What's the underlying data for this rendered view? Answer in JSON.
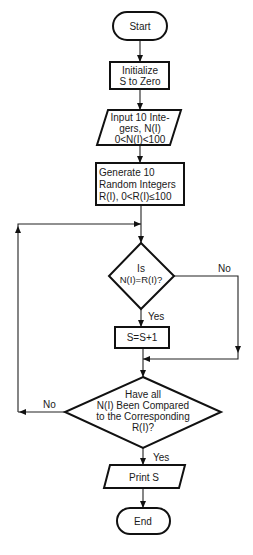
{
  "diagram": {
    "type": "flowchart",
    "nodes": {
      "start": {
        "shape": "terminal",
        "label": "Start"
      },
      "init": {
        "shape": "process",
        "lines": [
          "Initialize",
          "S to Zero"
        ]
      },
      "input": {
        "shape": "io",
        "lines": [
          "Input 10 Inte-",
          "gers, N(I)",
          "0<N(I)<100"
        ]
      },
      "generate": {
        "shape": "process",
        "lines": [
          "Generate 10",
          "Random Integers",
          "R(I), 0<R(I)≤100"
        ]
      },
      "decision1": {
        "shape": "decision",
        "lines": [
          "Is",
          "N(I)=R(I)?"
        ]
      },
      "increment": {
        "shape": "process",
        "label": "S=S+1"
      },
      "decision2": {
        "shape": "decision",
        "lines": [
          "Have all",
          "N(I) Been Compared",
          "to the Corresponding",
          "R(I)?"
        ]
      },
      "print": {
        "shape": "io",
        "label": "Print S"
      },
      "end": {
        "shape": "terminal",
        "label": "End"
      }
    },
    "edge_labels": {
      "d1_yes": "Yes",
      "d1_no": "No",
      "d2_yes": "Yes",
      "d2_no": "No"
    },
    "edges": [
      {
        "from": "start",
        "to": "init"
      },
      {
        "from": "init",
        "to": "input"
      },
      {
        "from": "input",
        "to": "generate"
      },
      {
        "from": "generate",
        "to": "decision1"
      },
      {
        "from": "decision1",
        "to": "increment",
        "label": "Yes"
      },
      {
        "from": "decision1",
        "to": "decision2",
        "label": "No"
      },
      {
        "from": "increment",
        "to": "decision2"
      },
      {
        "from": "decision2",
        "to": "print",
        "label": "Yes"
      },
      {
        "from": "decision2",
        "to": "decision1",
        "label": "No"
      },
      {
        "from": "print",
        "to": "end"
      }
    ],
    "colors": {
      "stroke": "#111111",
      "background": "#ffffff",
      "text": "#1a1a1a"
    }
  }
}
